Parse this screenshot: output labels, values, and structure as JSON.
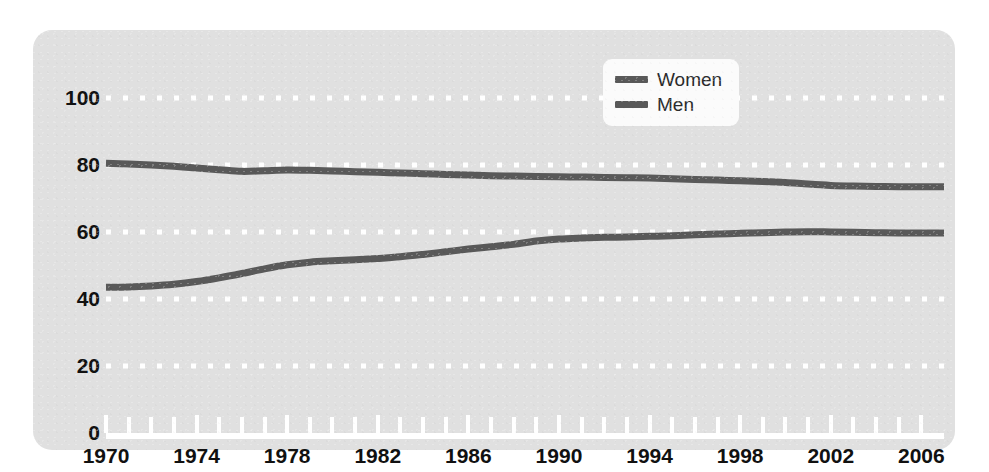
{
  "axis_title_fragment": "Percent",
  "legend": {
    "position": "top-center-right",
    "entries": [
      {
        "label": "Women",
        "color": "#595959",
        "swatch": "line-swatch"
      },
      {
        "label": "Men",
        "color": "#595959",
        "swatch": "line-swatch"
      }
    ]
  },
  "colors": {
    "panel_background": "#e0e0e0",
    "gridline": "#ffffff",
    "axis": "#ffffff",
    "tick_label": "#111111",
    "series_women": "#595959",
    "series_men": "#595959",
    "legend_background": "#fbfbfb"
  },
  "chart_data": {
    "type": "line",
    "title": "",
    "subtitle": "",
    "xlabel": "",
    "ylabel": "",
    "xlim": [
      1970,
      2007
    ],
    "ylim": [
      0,
      100
    ],
    "grid": "horizontal-dotted",
    "legend_position": "top-center",
    "y_ticks": [
      0,
      20,
      40,
      60,
      80,
      100
    ],
    "y_tick_labels": [
      "0",
      "20",
      "40",
      "60",
      "80",
      "100"
    ],
    "x_ticks": [
      1970,
      1974,
      1978,
      1982,
      1986,
      1990,
      1994,
      1998,
      2002,
      2006
    ],
    "x_tick_labels": [
      "1970",
      "1974",
      "1978",
      "1982",
      "1986",
      "1990",
      "1994",
      "1998",
      "2002",
      "2006"
    ],
    "x_minor_tick_interval": 1,
    "x": [
      1970,
      1971,
      1972,
      1973,
      1974,
      1975,
      1976,
      1977,
      1978,
      1979,
      1980,
      1981,
      1982,
      1983,
      1984,
      1985,
      1986,
      1987,
      1988,
      1989,
      1990,
      1991,
      1992,
      1993,
      1994,
      1995,
      1996,
      1997,
      1998,
      1999,
      2000,
      2001,
      2002,
      2003,
      2004,
      2005,
      2006,
      2007
    ],
    "series": [
      {
        "name": "Women",
        "color": "#595959",
        "values": [
          80.5,
          80.3,
          80.0,
          79.6,
          79.1,
          78.6,
          78.1,
          78.3,
          78.5,
          78.4,
          78.2,
          78.0,
          77.8,
          77.6,
          77.4,
          77.2,
          77.0,
          76.8,
          76.7,
          76.6,
          76.5,
          76.4,
          76.3,
          76.2,
          76.1,
          75.9,
          75.7,
          75.5,
          75.3,
          75.1,
          74.8,
          74.3,
          73.9,
          73.7,
          73.6,
          73.5,
          73.5,
          73.5
        ]
      },
      {
        "name": "Men",
        "color": "#595959",
        "values": [
          43.5,
          43.6,
          43.9,
          44.4,
          45.2,
          46.3,
          47.6,
          49.0,
          50.2,
          51.0,
          51.4,
          51.7,
          52.1,
          52.6,
          53.3,
          54.1,
          54.9,
          55.6,
          56.3,
          57.3,
          57.9,
          58.2,
          58.4,
          58.5,
          58.7,
          58.9,
          59.2,
          59.4,
          59.6,
          59.8,
          60.0,
          60.1,
          60.0,
          59.9,
          59.8,
          59.7,
          59.7,
          59.7
        ]
      }
    ]
  }
}
